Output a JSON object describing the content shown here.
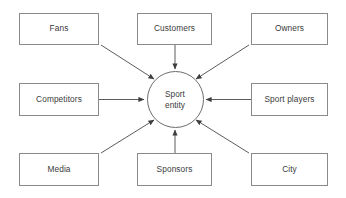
{
  "diagram": {
    "type": "hub-and-spoke",
    "center": {
      "id": "sport-entity",
      "line1": "Sport",
      "line2": "entity",
      "shape": "circle",
      "cx": 175,
      "cy": 99.5,
      "r": 28.5,
      "stroke": "#6e6e6e",
      "fill": "#ffffff"
    },
    "style": {
      "box_stroke": "#8a8a8a",
      "box_fill": "#ffffff",
      "text_color": "#3b3b3b",
      "arrow_color": "#4a4a4a",
      "background": "#ffffff"
    },
    "nodes": [
      {
        "id": "fans",
        "label": "Fans",
        "x": 19,
        "y": 13,
        "w": 80,
        "h": 32,
        "arrow": {
          "from": [
            101,
            45
          ],
          "to": [
            154,
            79
          ],
          "kind": "diagonal"
        }
      },
      {
        "id": "customers",
        "label": "Customers",
        "x": 137,
        "y": 13,
        "w": 75,
        "h": 32,
        "arrow": {
          "from": [
            175,
            45
          ],
          "to": [
            175,
            69
          ],
          "kind": "vertical"
        }
      },
      {
        "id": "owners",
        "label": "Owners",
        "x": 251,
        "y": 13,
        "w": 77,
        "h": 32,
        "arrow": {
          "from": [
            249,
            45
          ],
          "to": [
            196,
            79
          ],
          "kind": "diagonal"
        }
      },
      {
        "id": "competitors",
        "label": "Competitors",
        "x": 19,
        "y": 83,
        "w": 80,
        "h": 33,
        "arrow": {
          "from": [
            99,
            99.5
          ],
          "to": [
            144,
            99.5
          ],
          "kind": "horizontal"
        }
      },
      {
        "id": "sport-players",
        "label": "Sport players",
        "x": 251,
        "y": 83,
        "w": 77,
        "h": 33,
        "arrow": {
          "from": [
            251,
            99.5
          ],
          "to": [
            206,
            99.5
          ],
          "kind": "horizontal"
        }
      },
      {
        "id": "media",
        "label": "Media",
        "x": 19,
        "y": 153,
        "w": 80,
        "h": 33,
        "arrow": {
          "from": [
            101,
            153
          ],
          "to": [
            154,
            120
          ],
          "kind": "diagonal"
        }
      },
      {
        "id": "sponsors",
        "label": "Sponsors",
        "x": 137,
        "y": 153,
        "w": 75,
        "h": 33,
        "arrow": {
          "from": [
            175,
            153
          ],
          "to": [
            175,
            130
          ],
          "kind": "vertical"
        }
      },
      {
        "id": "city",
        "label": "City",
        "x": 251,
        "y": 153,
        "w": 77,
        "h": 33,
        "arrow": {
          "from": [
            249,
            153
          ],
          "to": [
            196,
            120
          ],
          "kind": "diagonal"
        }
      }
    ]
  }
}
